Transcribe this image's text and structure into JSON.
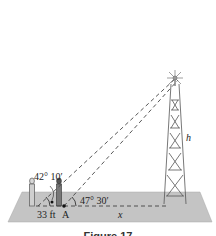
{
  "figure": {
    "caption": "Figure 17",
    "labels": {
      "angle_far": "42° 10′",
      "angle_near": "47° 30′",
      "distance_between": "33 ft",
      "point": "A",
      "distance_to_tower": "x",
      "tower_height": "h"
    },
    "colors": {
      "ground": "#bdbdbd",
      "ground_edge": "#9a9a9a",
      "tower": "#555555",
      "dashed_line": "#444444"
    }
  }
}
